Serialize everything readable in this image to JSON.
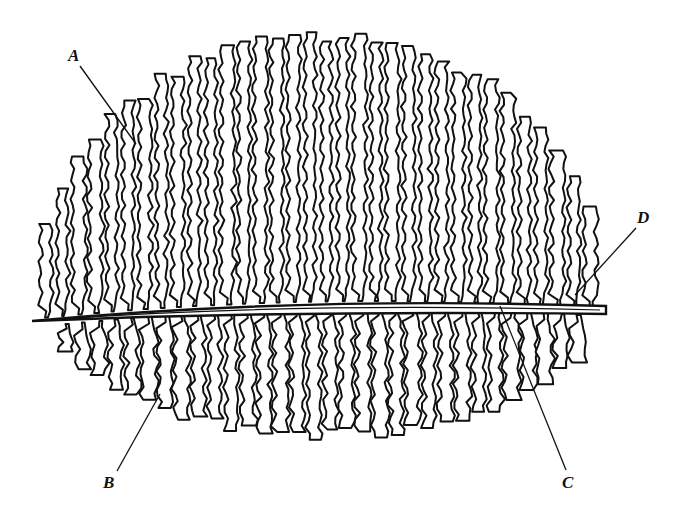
{
  "diagram": {
    "ink_color": "#111111",
    "background": "#ffffff",
    "labels": [
      {
        "id": "A",
        "text": "A"
      },
      {
        "id": "B",
        "text": "B"
      },
      {
        "id": "C",
        "text": "C"
      },
      {
        "id": "D",
        "text": "D"
      }
    ]
  }
}
